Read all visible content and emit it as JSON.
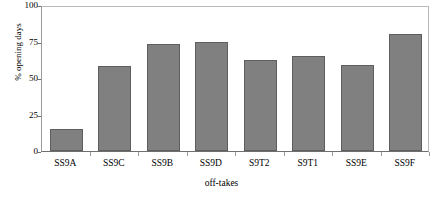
{
  "chart_data": {
    "type": "bar",
    "title": "",
    "subtitle": "",
    "xlabel": "off-takes",
    "ylabel": "% opening days",
    "categories": [
      "SS9A",
      "SS9C",
      "SS9B",
      "SS9D",
      "S9T2",
      "S9T1",
      "SS9E",
      "SS9F"
    ],
    "values": [
      15,
      58,
      73,
      75,
      62,
      65,
      59,
      80
    ],
    "ylim": [
      0,
      100
    ],
    "yticks": [
      0,
      25,
      50,
      75,
      100
    ],
    "ytick_labels": [
      "0",
      "25",
      "50",
      "75",
      "100"
    ],
    "grid": false,
    "legend": null,
    "legend_position": "none",
    "bar_color": "#808080",
    "bar_edge_color": "#5e5e5e",
    "axis_color": "#6f6f6f",
    "background_color": "#ffffff",
    "text_color": "#000000"
  }
}
